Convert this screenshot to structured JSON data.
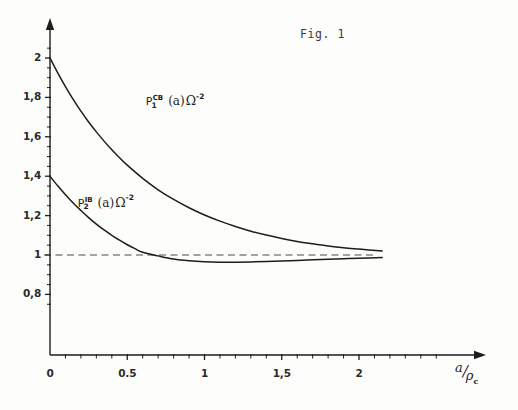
{
  "figure": {
    "caption": "Fig. 1",
    "background_color": "#fdfdfc",
    "ink_color": "#1d1d1d"
  },
  "chart_data": {
    "type": "line",
    "title": "Fig. 1",
    "xlabel": "a/ρc",
    "ylabel": "",
    "xlim": [
      0,
      2.2
    ],
    "ylim": [
      0.72,
      2.12
    ],
    "grid": false,
    "legend": "inline-labels",
    "x_ticks_major": [
      0,
      0.5,
      1,
      1.5,
      2
    ],
    "x_tick_labels": [
      "0",
      "0.5",
      "1",
      "1,5",
      "2"
    ],
    "x_ticks_minor_step": 0.1,
    "y_ticks_major": [
      0.8,
      1.0,
      1.2,
      1.4,
      1.6,
      1.8,
      2.0
    ],
    "y_tick_labels": [
      "0,8",
      "1",
      "1,2",
      "1,4",
      "1,6",
      "1,8",
      "2"
    ],
    "y_ticks_minor_step": 0.05,
    "annotations": [
      {
        "name": "asymptote",
        "type": "hline",
        "y": 1.0,
        "style": "dashed",
        "x_start": 0,
        "x_end": 2.12
      }
    ],
    "series": [
      {
        "name": "P1_CB",
        "label_text": "P₁^CB(a).Ω⁻²",
        "label_base": "P",
        "label_sub": "1",
        "label_sup": "CB",
        "label_arg": "(a)",
        "label_factor": "Ω",
        "label_exp": "-2",
        "label_x": 0.62,
        "label_y": 1.78,
        "color": "#1d1d1d",
        "x": [
          0,
          0.05,
          0.1,
          0.15,
          0.2,
          0.25,
          0.3,
          0.35,
          0.4,
          0.45,
          0.5,
          0.6,
          0.7,
          0.8,
          0.9,
          1.0,
          1.1,
          1.2,
          1.3,
          1.4,
          1.5,
          1.6,
          1.7,
          1.8,
          1.9,
          2.0,
          2.15
        ],
        "y": [
          2.0,
          1.925,
          1.855,
          1.79,
          1.73,
          1.675,
          1.625,
          1.578,
          1.534,
          1.494,
          1.456,
          1.389,
          1.331,
          1.282,
          1.24,
          1.203,
          1.172,
          1.145,
          1.121,
          1.101,
          1.084,
          1.069,
          1.057,
          1.046,
          1.037,
          1.03,
          1.02
        ]
      },
      {
        "name": "P2_IB",
        "label_text": "P₂^IB(a).Ω⁻²",
        "label_base": "P",
        "label_sub": "2",
        "label_sup": "IB",
        "label_arg": "(a)",
        "label_factor": "Ω",
        "label_exp": "-2",
        "label_x": 0.18,
        "label_y": 1.265,
        "color": "#1d1d1d",
        "x": [
          0,
          0.05,
          0.1,
          0.15,
          0.2,
          0.25,
          0.3,
          0.35,
          0.4,
          0.45,
          0.5,
          0.55,
          0.6,
          0.7,
          0.8,
          0.9,
          1.0,
          1.1,
          1.2,
          1.3,
          1.4,
          1.5,
          1.6,
          1.7,
          1.8,
          1.9,
          2.0,
          2.15
        ],
        "y": [
          1.4,
          1.351,
          1.306,
          1.264,
          1.226,
          1.19,
          1.157,
          1.127,
          1.1,
          1.075,
          1.052,
          1.032,
          1.014,
          0.9955,
          0.9795,
          0.9705,
          0.9655,
          0.9635,
          0.9635,
          0.9648,
          0.967,
          0.9697,
          0.9727,
          0.9757,
          0.9787,
          0.9815,
          0.984,
          0.987
        ]
      }
    ]
  },
  "axes": {
    "y_arrow": true,
    "x_arrow": true,
    "origin_label": "0"
  }
}
